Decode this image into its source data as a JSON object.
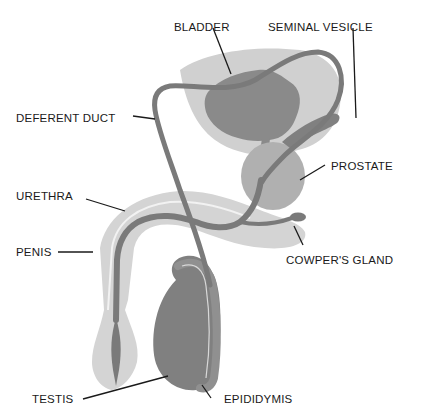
{
  "diagram": {
    "colors": {
      "background": "#ffffff",
      "light_tissue": "#d4d4d4",
      "medium_tissue": "#b0b0b0",
      "dark_tissue": "#808080",
      "duct": "#7a7a7a",
      "label": "#1a1a1a"
    },
    "labels": [
      {
        "id": "bladder",
        "text": "BLADDER"
      },
      {
        "id": "seminal_vesicle",
        "text": "SEMINAL VESICLE"
      },
      {
        "id": "deferent_duct",
        "text": "DEFERENT DUCT"
      },
      {
        "id": "prostate",
        "text": "PROSTATE"
      },
      {
        "id": "urethra",
        "text": "URETHRA"
      },
      {
        "id": "penis",
        "text": "PENIS"
      },
      {
        "id": "cowpers_gland",
        "text": "COWPER'S GLAND"
      },
      {
        "id": "testis",
        "text": "TESTIS"
      },
      {
        "id": "epididymis",
        "text": "EPIDIDYMIS"
      }
    ]
  }
}
